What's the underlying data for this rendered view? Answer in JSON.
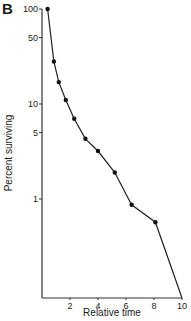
{
  "panel_label": "B",
  "chart_data": {
    "type": "line",
    "title": "",
    "xlabel": "Relative time",
    "ylabel": "Percent surviving",
    "y_scale": "log",
    "xlim": [
      0,
      10
    ],
    "ylim": [
      0.09,
      100
    ],
    "x_ticks": [
      2,
      4,
      6,
      8,
      10
    ],
    "y_ticks": [
      100,
      50,
      10,
      5,
      1
    ],
    "grid": false,
    "legend": null,
    "series": [
      {
        "name": "survival",
        "marker": "filled-circle",
        "x": [
          0.4,
          0.85,
          1.2,
          1.7,
          2.3,
          3.1,
          4.0,
          5.2,
          6.4,
          8.1,
          10
        ],
        "y": [
          100,
          28,
          17,
          11,
          7,
          4.3,
          3.2,
          1.9,
          0.87,
          0.57,
          0.09
        ],
        "markers_shown": [
          true,
          true,
          true,
          true,
          true,
          true,
          true,
          true,
          true,
          true,
          false
        ]
      }
    ]
  }
}
